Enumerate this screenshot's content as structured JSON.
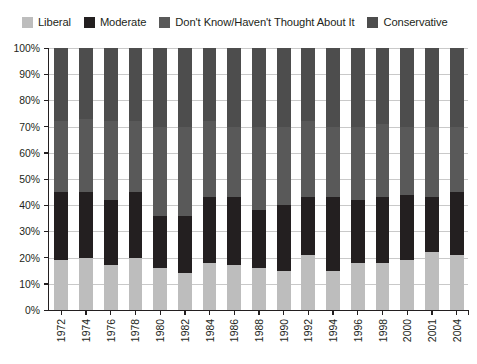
{
  "legend": {
    "position": "top-left",
    "items": [
      {
        "label": "Liberal",
        "color": "#bdbdbd",
        "swatch_name": "legend-swatch-liberal"
      },
      {
        "label": "Moderate",
        "color": "#231f20",
        "swatch_name": "legend-swatch-moderate"
      },
      {
        "label": "Don't Know/Haven't Thought About It",
        "color": "#595959",
        "swatch_name": "legend-swatch-dont-know"
      },
      {
        "label": "Conservative",
        "color": "#4d4d4d",
        "swatch_name": "legend-swatch-conservative"
      }
    ]
  },
  "chart_data": {
    "type": "bar",
    "subtype": "stacked-100-percent",
    "title": "",
    "subtitle": "",
    "xlabel": "",
    "ylabel": "",
    "ylim": [
      0,
      100
    ],
    "yunit": "%",
    "grid": true,
    "legend_position": "top-left",
    "categories": [
      "1972",
      "1974",
      "1976",
      "1978",
      "1980",
      "1982",
      "1984",
      "1986",
      "1988",
      "1990",
      "1992",
      "1994",
      "1996",
      "1998",
      "2000",
      "2001",
      "2004"
    ],
    "ytick_labels": [
      "0%",
      "10%",
      "20%",
      "30%",
      "40%",
      "50%",
      "60%",
      "70%",
      "80%",
      "90%",
      "100%"
    ],
    "ytick_values": [
      0,
      10,
      20,
      30,
      40,
      50,
      60,
      70,
      80,
      90,
      100
    ],
    "series": [
      {
        "name": "Liberal",
        "color": "#bdbdbd",
        "values": [
          19,
          20,
          17,
          20,
          16,
          14,
          18,
          17,
          16,
          15,
          21,
          15,
          18,
          18,
          19,
          22,
          21
        ]
      },
      {
        "name": "Moderate",
        "color": "#231f20",
        "values": [
          26,
          25,
          25,
          25,
          20,
          22,
          25,
          26,
          22,
          25,
          22,
          28,
          24,
          25,
          25,
          21,
          24
        ]
      },
      {
        "name": "Don't Know/Haven't Thought About It",
        "color": "#595959",
        "values": [
          27,
          28,
          30,
          27,
          34,
          34,
          29,
          27,
          32,
          30,
          29,
          27,
          28,
          28,
          26,
          27,
          25
        ]
      },
      {
        "name": "Conservative",
        "color": "#4d4d4d",
        "values": [
          28,
          27,
          28,
          28,
          30,
          30,
          28,
          30,
          30,
          30,
          28,
          30,
          30,
          29,
          30,
          30,
          30
        ]
      }
    ]
  },
  "style": {
    "axis_color": "#231f20",
    "gridline_color": "#c9c9c9",
    "background": "#ffffff"
  }
}
